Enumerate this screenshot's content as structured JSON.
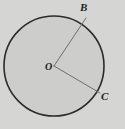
{
  "figure": {
    "type": "circle-with-two-radii",
    "background_color": "#d5d5d3",
    "circle": {
      "name": "circle-O",
      "center_label": "O",
      "center_x": 54,
      "center_y": 66,
      "radius": 50,
      "stroke_color": "#2b2b2b",
      "stroke_width": 1.6,
      "fill_color": "#cdcdcb"
    },
    "radii": [
      {
        "name": "radius-OB",
        "from_label": "O",
        "to_label": "B",
        "x1": 54,
        "y1": 66,
        "x2": 86,
        "y2": 18,
        "stroke_color": "#6e6e6e",
        "stroke_width": 1
      },
      {
        "name": "radius-OC",
        "from_label": "O",
        "to_label": "C",
        "x1": 54,
        "y1": 66,
        "x2": 100,
        "y2": 93,
        "stroke_color": "#6e6e6e",
        "stroke_width": 1
      }
    ],
    "labels": {
      "center": "O",
      "point_upper": "B",
      "point_lower": "C"
    }
  }
}
